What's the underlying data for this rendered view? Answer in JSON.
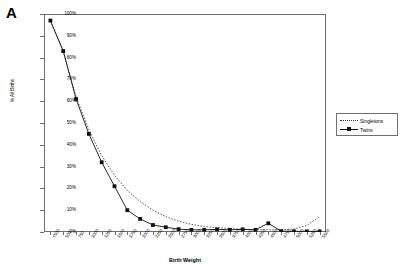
{
  "figure": {
    "panel_label": "A"
  },
  "legend": {
    "position": "right",
    "entries": [
      {
        "label": "Singletons",
        "style": "dotted"
      },
      {
        "label": "Twins",
        "style": "solid-square-marker"
      }
    ]
  },
  "chart_data": {
    "type": "line",
    "title": "",
    "xlabel": "Birth Weight",
    "ylabel": "% All Births",
    "ylim": [
      0,
      100
    ],
    "ytick_labels": [
      "0%",
      "10%",
      "20%",
      "30%",
      "40%",
      "50%",
      "60%",
      "70%",
      "80%",
      "90%",
      "100%"
    ],
    "ytick_values": [
      0,
      10,
      20,
      30,
      40,
      50,
      60,
      70,
      80,
      90,
      100
    ],
    "grid": false,
    "categories": [
      "<500",
      "500",
      "750",
      "1000",
      "1250",
      "1500",
      "1750",
      "2000",
      "2250",
      "2500",
      "2750",
      "3000",
      "3250",
      "3500",
      "3750",
      "4000",
      "4250",
      "4500",
      "4750",
      "5000",
      "5250",
      "5500"
    ],
    "series": [
      {
        "name": "Singletons",
        "style": "dotted",
        "markers": false,
        "values": [
          96.5,
          83.0,
          62.0,
          47.0,
          35.0,
          26.0,
          19.0,
          14.0,
          10.0,
          7.0,
          5.0,
          3.5,
          2.5,
          2.0,
          1.6,
          1.3,
          1.1,
          1.0,
          1.0,
          1.4,
          3.0,
          7.0
        ]
      },
      {
        "name": "Twins",
        "style": "solid",
        "markers": true,
        "values": [
          97.0,
          83.0,
          61.0,
          45.0,
          32.0,
          21.0,
          10.0,
          6.0,
          3.2,
          2.2,
          1.3,
          1.0,
          1.0,
          1.2,
          1.0,
          1.2,
          1.0,
          4.0,
          0.4,
          0.3,
          0.3,
          0.3
        ]
      }
    ],
    "annotations": []
  }
}
